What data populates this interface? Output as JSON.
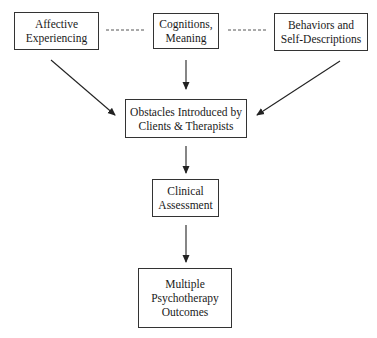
{
  "diagram": {
    "type": "flowchart",
    "nodes": [
      {
        "id": "affective",
        "lines": [
          "Affective",
          "Experiencing"
        ]
      },
      {
        "id": "cognitions",
        "lines": [
          "Cognitions,",
          "Meaning"
        ]
      },
      {
        "id": "behaviors",
        "lines": [
          "Behaviors and",
          "Self-Descriptions"
        ]
      },
      {
        "id": "obstacles",
        "lines": [
          "Obstacles Introduced by",
          "Clients & Therapists"
        ]
      },
      {
        "id": "assessment",
        "lines": [
          "Clinical",
          "Assessment"
        ]
      },
      {
        "id": "outcomes",
        "lines": [
          "Multiple",
          "Psychotherapy",
          "Outcomes"
        ]
      }
    ],
    "edges": [
      {
        "from": "affective",
        "to": "cognitions",
        "style": "dashed",
        "arrow": false
      },
      {
        "from": "cognitions",
        "to": "behaviors",
        "style": "dashed",
        "arrow": false
      },
      {
        "from": "affective",
        "to": "obstacles",
        "style": "solid",
        "arrow": true
      },
      {
        "from": "cognitions",
        "to": "obstacles",
        "style": "solid",
        "arrow": true
      },
      {
        "from": "behaviors",
        "to": "obstacles",
        "style": "solid",
        "arrow": true
      },
      {
        "from": "obstacles",
        "to": "assessment",
        "style": "solid",
        "arrow": true
      },
      {
        "from": "assessment",
        "to": "outcomes",
        "style": "solid",
        "arrow": true
      }
    ],
    "colors": {
      "stroke": "#333333",
      "text": "#1a1a1a",
      "background": "#ffffff"
    }
  }
}
